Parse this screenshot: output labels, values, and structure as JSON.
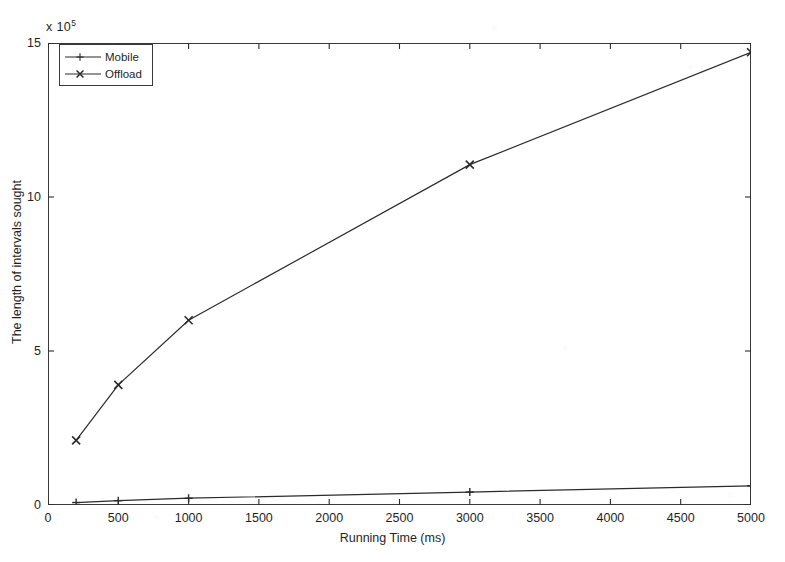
{
  "chart_data": {
    "type": "line",
    "title": "",
    "xlabel": "Running Time (ms)",
    "ylabel": "The length of intervals sought",
    "y_exponent_label": "x 10",
    "y_exponent_power": "5",
    "xlim": [
      0,
      5000
    ],
    "ylim": [
      0,
      15
    ],
    "xticks": [
      0,
      500,
      1000,
      1500,
      2000,
      2500,
      3000,
      3500,
      4000,
      4500,
      5000
    ],
    "xtick_labels": [
      "0",
      "500",
      "1000",
      "1500",
      "2000",
      "2500",
      "3000",
      "3500",
      "4000",
      "4500",
      "5000"
    ],
    "yticks": [
      0,
      5,
      10,
      15
    ],
    "ytick_labels": [
      "0",
      "5",
      "10",
      "15"
    ],
    "grid": false,
    "legend_position": "upper left",
    "x": [
      200,
      500,
      1000,
      3000,
      5000
    ],
    "series": [
      {
        "name": "Mobile",
        "marker": "plus",
        "color": "#2b2b2b",
        "values": [
          0.08,
          0.14,
          0.22,
          0.42,
          0.62
        ]
      },
      {
        "name": "Offload",
        "marker": "x",
        "color": "#2b2b2b",
        "values": [
          2.1,
          3.9,
          6.0,
          11.05,
          14.7
        ]
      }
    ]
  },
  "legend": {
    "items": [
      {
        "label": "Mobile",
        "marker": "plus"
      },
      {
        "label": "Offload",
        "marker": "x"
      }
    ]
  }
}
